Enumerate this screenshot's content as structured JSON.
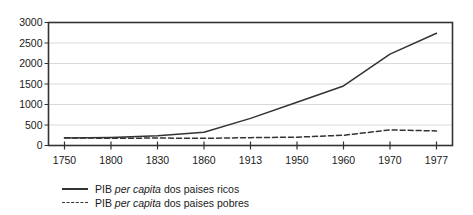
{
  "chart_data": {
    "type": "line",
    "title": "",
    "subtitle": "",
    "xlabel": "",
    "ylabel": "",
    "categories": [
      "1750",
      "1800",
      "1830",
      "1860",
      "1913",
      "1950",
      "1960",
      "1970",
      "1977"
    ],
    "ylim": [
      0,
      3000
    ],
    "yticks": [
      0,
      500,
      1000,
      1500,
      2000,
      2500,
      3000
    ],
    "ytick_labels": [
      "0",
      "500",
      "1000",
      "1500",
      "2000",
      "2500",
      "3000"
    ],
    "grid": "horizontal",
    "grid_color": "#d9d9d9",
    "legend_position": "below-left",
    "frame_color": "#333333",
    "series": [
      {
        "name": "PIB per capita dos paises ricos",
        "style": "solid",
        "color": "#333333",
        "values": [
          182,
          198,
          237,
          324,
          662,
          1054,
          1453,
          2229,
          2737
        ]
      },
      {
        "name": "PIB per capita dos paises pobres",
        "style": "dashed",
        "color": "#333333",
        "values": [
          188,
          175,
          182,
          174,
          192,
          203,
          250,
          380,
          355
        ]
      }
    ]
  },
  "legend": {
    "items": [
      {
        "prefix": "PIB ",
        "italic": "per capita",
        "suffix": " dos paises ricos",
        "style": "solid"
      },
      {
        "prefix": "PIB ",
        "italic": "per capita",
        "suffix": " dos paises pobres",
        "style": "dashed"
      }
    ]
  }
}
